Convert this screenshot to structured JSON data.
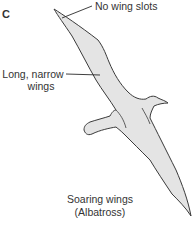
{
  "figure": {
    "panel_letter": "C",
    "annotations": [
      {
        "id": "no-wing-slots",
        "text": "No wing slots"
      },
      {
        "id": "long-narrow-wings",
        "line1": "Long, narrow",
        "line2": "wings"
      }
    ],
    "caption": {
      "line1": "Soaring wings",
      "line2": "(Albatross)"
    },
    "colors": {
      "wing_fill": "#e4e4e4",
      "outline": "#3a3a3a",
      "text": "#333333"
    }
  }
}
